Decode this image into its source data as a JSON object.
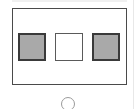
{
  "diagram": {
    "frame": {
      "stroke": "#4a4a4a",
      "fill": "#ffffff"
    },
    "squares": [
      {
        "id": "left",
        "state": "filled",
        "fill": "#a9a9a9"
      },
      {
        "id": "middle",
        "state": "empty",
        "fill": "#ffffff"
      },
      {
        "id": "right",
        "state": "filled",
        "fill": "#a9a9a9"
      }
    ],
    "indicator": {
      "shape": "circle",
      "stroke": "#9a9a9a"
    }
  }
}
